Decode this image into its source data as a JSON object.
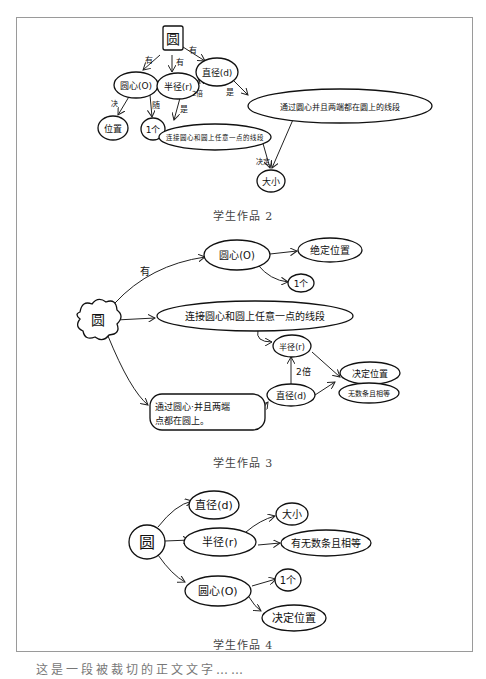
{
  "document": {
    "captions": [
      "学生作品 2",
      "学生作品 3",
      "学生作品 4"
    ],
    "bottom_text_cropped": "这是一段被裁切的正文文字……"
  },
  "work2": {
    "root": "圆",
    "nodes": {
      "center": "圆心(O)",
      "radius": "半径(r)",
      "diameter": "直径(d)",
      "position": "位置",
      "one": "1个",
      "radius_def": "连接圆心和圆上任意一点的线段",
      "diameter_def": "通过圆心并且两端都在圆上的线段",
      "size": "大小"
    },
    "edges": {
      "has1": "有",
      "has2": "有",
      "has3": "有",
      "decides": "决",
      "with": "随",
      "is1": "是",
      "is2": "是",
      "times2": "2倍",
      "decides_size": "决定"
    }
  },
  "work3": {
    "root": "圆",
    "nodes": {
      "center": "圆心(O)",
      "decide_pos": "绝定位置",
      "one": "1个",
      "radius_def": "连接圆心和圆上任意一点的线段",
      "radius": "半径(r)",
      "diameter_def_1": "通过圆心·并且两端",
      "diameter_def_2": "点都在圆上。",
      "diameter": "直径(d)",
      "result_1": "决定位置",
      "result_2": "无数条且相等"
    },
    "edges": {
      "has": "有",
      "times2": "2倍"
    }
  },
  "work4": {
    "root": "圆",
    "nodes": {
      "diameter": "直径(d)",
      "radius": "半径(r)",
      "center": "圆心(O)",
      "size": "大小",
      "infinite": "有无数条且相等",
      "one": "1个",
      "decide_pos": "决定位置"
    }
  }
}
